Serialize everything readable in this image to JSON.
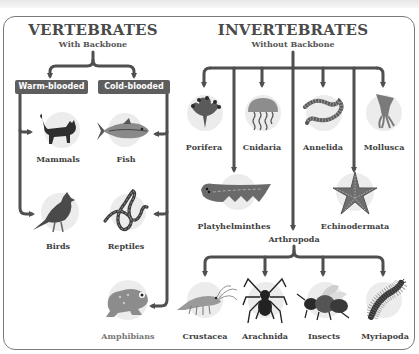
{
  "vertebrates": {
    "title": "VERTEBRATES",
    "subtitle": "With Backbone",
    "groups": [
      {
        "label": "Warm-blooded",
        "members": [
          "Mammals",
          "Birds"
        ]
      },
      {
        "label": "Cold-blooded",
        "members": [
          "Fish",
          "Reptiles",
          "Amphibians"
        ]
      }
    ],
    "classes": {
      "mammals": {
        "label": "Mammals",
        "icon": "cat-icon"
      },
      "fish": {
        "label": "Fish",
        "icon": "fish-icon"
      },
      "birds": {
        "label": "Birds",
        "icon": "cardinal-bird-icon"
      },
      "reptiles": {
        "label": "Reptiles",
        "icon": "snake-icon"
      },
      "amphibians": {
        "label": "Amphibians",
        "icon": "frog-icon"
      }
    }
  },
  "invertebrates": {
    "title": "INVERTEBRATES",
    "subtitle": "Without Backbone",
    "phyla": {
      "porifera": {
        "label": "Porifera",
        "icon": "sponge-icon"
      },
      "cnidaria": {
        "label": "Cnidaria",
        "icon": "jellyfish-icon"
      },
      "annelida": {
        "label": "Annelida",
        "icon": "worm-icon"
      },
      "mollusca": {
        "label": "Mollusca",
        "icon": "squid-icon"
      },
      "platyhelminthes": {
        "label": "Platyhelminthes",
        "icon": "flatworm-icon"
      },
      "echinodermata": {
        "label": "Echinodermata",
        "icon": "starfish-icon"
      },
      "arthropoda": {
        "label": "Arthropoda"
      }
    },
    "arthropoda_subgroups": {
      "crustacea": {
        "label": "Crustacea",
        "icon": "shrimp-icon"
      },
      "arachnida": {
        "label": "Arachnida",
        "icon": "spider-icon"
      },
      "insects": {
        "label": "Insects",
        "icon": "bee-icon"
      },
      "myriapoda": {
        "label": "Myriapoda",
        "icon": "millipede-icon"
      }
    }
  },
  "colors": {
    "line": "#4f4f4f",
    "tag_bg": "#5e5e5e",
    "circle_bg": "#ececec",
    "frame_border": "#7a7a7a"
  }
}
